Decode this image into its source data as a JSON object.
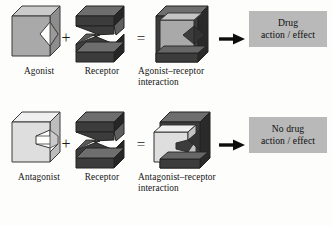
{
  "figure": {
    "background_color": "#fdfdfb",
    "rows": [
      {
        "id": "agonist-row",
        "drug": {
          "name": "agonist-block",
          "label": "Agonist",
          "face_color": "#a9a9a9",
          "top_color": "#cccccc",
          "side_color": "#8e8e8e",
          "notch": "v-notch"
        },
        "operator_plus": "+",
        "receptor": {
          "name": "receptor-block",
          "label": "Receptor",
          "face_color": "#3c3c3c",
          "top_color": "#6e6e6e",
          "side_color": "#2a2a2a",
          "shape": "zigzag-3"
        },
        "operator_equals": "=",
        "complex": {
          "name": "agonist-receptor-complex",
          "label_line1": "Agonist–receptor",
          "label_line2": "interaction",
          "fit": "complete"
        },
        "arrow": "right-arrow",
        "outcome": {
          "name": "drug-action-box",
          "line1": "Drug",
          "line2": "action / effect",
          "box_color": "#b9b9b9"
        }
      },
      {
        "id": "antagonist-row",
        "drug": {
          "name": "antagonist-block",
          "label": "Antagonist",
          "face_color": "#d9d9d9",
          "top_color": "#f0f0f0",
          "side_color": "#bdbdbd",
          "notch": "step-notch"
        },
        "operator_plus": "+",
        "receptor": {
          "name": "receptor-block",
          "label": "Receptor",
          "face_color": "#3c3c3c",
          "top_color": "#6e6e6e",
          "side_color": "#2a2a2a",
          "shape": "zigzag-3"
        },
        "operator_equals": "=",
        "complex": {
          "name": "antagonist-receptor-complex",
          "label_line1": "Antagonist–receptor",
          "label_line2": "interaction",
          "fit": "partial"
        },
        "arrow": "right-arrow",
        "outcome": {
          "name": "no-drug-action-box",
          "line1": "No drug",
          "line2": "action / effect",
          "box_color": "#b9b9b9"
        }
      }
    ]
  }
}
